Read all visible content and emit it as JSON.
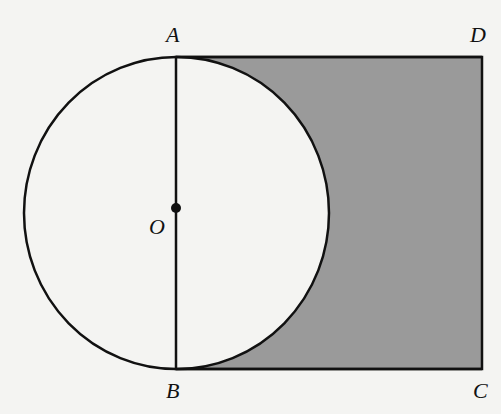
{
  "diagram": {
    "colors": {
      "background": "#f4f4f2",
      "stroke": "#111111",
      "shade": "#9a9a9a",
      "circle_fill": "#f4f4f2"
    },
    "points": {
      "A": {
        "label": "A",
        "x": 176,
        "y": 57
      },
      "B": {
        "label": "B",
        "x": 176,
        "y": 369
      },
      "C": {
        "label": "C",
        "x": 482,
        "y": 369
      },
      "D": {
        "label": "D",
        "x": 482,
        "y": 57
      },
      "O": {
        "label": "O",
        "x": 176,
        "y": 208
      }
    },
    "circle": {
      "cx": 176.5,
      "cy": 213,
      "rx": 152.5,
      "ry": 156
    },
    "segments": [
      "AB",
      "AD",
      "DC",
      "CB"
    ],
    "shaded_region": "square ABCD minus semicircle"
  }
}
